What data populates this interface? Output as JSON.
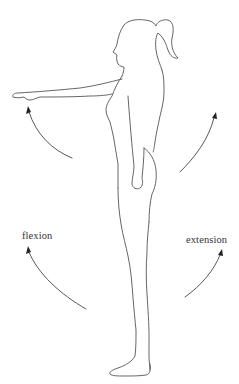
{
  "figure": {
    "labels": {
      "flexion": "flexion",
      "extension": "extension"
    },
    "arrows": [
      {
        "name": "flexion-arrow-upper",
        "direction": "forward-up"
      },
      {
        "name": "extension-arrow-upper",
        "direction": "backward-up"
      },
      {
        "name": "flexion-arrow-lower",
        "direction": "forward-up"
      },
      {
        "name": "extension-arrow-lower",
        "direction": "backward-up"
      }
    ],
    "colors": {
      "line": "#555555",
      "arrow": "#444444",
      "text": "#333333",
      "background": "#ffffff"
    }
  }
}
